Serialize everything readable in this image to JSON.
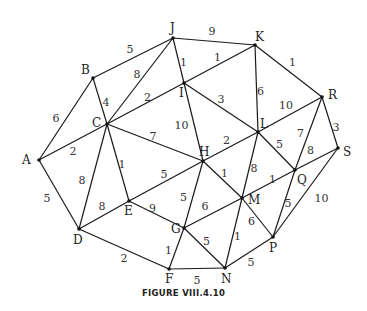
{
  "caption": "FIGURE VIII.4.10",
  "graph": {
    "nodes": [
      "A",
      "B",
      "C",
      "D",
      "E",
      "F",
      "G",
      "H",
      "I",
      "J",
      "K",
      "L",
      "M",
      "N",
      "P",
      "Q",
      "R",
      "S"
    ],
    "edges": [
      {
        "from": "A",
        "to": "B",
        "weight": "6"
      },
      {
        "from": "A",
        "to": "C",
        "weight": "2"
      },
      {
        "from": "A",
        "to": "D",
        "weight": "5"
      },
      {
        "from": "B",
        "to": "J",
        "weight": "5"
      },
      {
        "from": "B",
        "to": "C",
        "weight": "4"
      },
      {
        "from": "C",
        "to": "J",
        "weight": "8"
      },
      {
        "from": "C",
        "to": "I",
        "weight": "2"
      },
      {
        "from": "C",
        "to": "H",
        "weight": "7"
      },
      {
        "from": "C",
        "to": "E",
        "weight": "1"
      },
      {
        "from": "C",
        "to": "D",
        "weight": "8"
      },
      {
        "from": "J",
        "to": "K",
        "weight": "9"
      },
      {
        "from": "J",
        "to": "I",
        "weight": "1"
      },
      {
        "from": "I",
        "to": "K",
        "weight": "1"
      },
      {
        "from": "I",
        "to": "H",
        "weight": "10"
      },
      {
        "from": "I",
        "to": "L",
        "weight": "3"
      },
      {
        "from": "K",
        "to": "L",
        "weight": "6"
      },
      {
        "from": "K",
        "to": "R",
        "weight": "1"
      },
      {
        "from": "L",
        "to": "R",
        "weight": "10"
      },
      {
        "from": "L",
        "to": "H",
        "weight": "2"
      },
      {
        "from": "L",
        "to": "Q",
        "weight": "5"
      },
      {
        "from": "L",
        "to": "M",
        "weight": "8"
      },
      {
        "from": "R",
        "to": "S",
        "weight": "3"
      },
      {
        "from": "R",
        "to": "Q",
        "weight": "7"
      },
      {
        "from": "S",
        "to": "Q",
        "weight": "8"
      },
      {
        "from": "S",
        "to": "P",
        "weight": "10"
      },
      {
        "from": "H",
        "to": "E",
        "weight": "5"
      },
      {
        "from": "H",
        "to": "G",
        "weight": "5"
      },
      {
        "from": "H",
        "to": "M",
        "weight": "1"
      },
      {
        "from": "E",
        "to": "D",
        "weight": "8"
      },
      {
        "from": "E",
        "to": "G",
        "weight": "9"
      },
      {
        "from": "D",
        "to": "F",
        "weight": "2"
      },
      {
        "from": "G",
        "to": "M",
        "weight": "6"
      },
      {
        "from": "G",
        "to": "F",
        "weight": "1"
      },
      {
        "from": "G",
        "to": "N",
        "weight": "5"
      },
      {
        "from": "M",
        "to": "Q",
        "weight": "1"
      },
      {
        "from": "M",
        "to": "N",
        "weight": "1"
      },
      {
        "from": "M",
        "to": "P",
        "weight": "6"
      },
      {
        "from": "Q",
        "to": "P",
        "weight": "5"
      },
      {
        "from": "F",
        "to": "N",
        "weight": "5"
      },
      {
        "from": "N",
        "to": "P",
        "weight": "5"
      }
    ]
  }
}
